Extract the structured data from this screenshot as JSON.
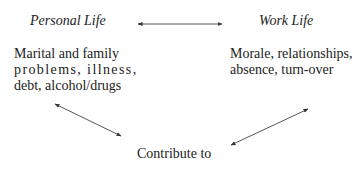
{
  "diagram": {
    "personal": {
      "heading": "Personal Life",
      "lines": [
        "Marital and family",
        "problems, illness,",
        "debt, alcohol/drugs"
      ]
    },
    "work": {
      "heading": "Work Life",
      "lines": [
        "Morale, relationships,",
        "absence, turn-over"
      ]
    },
    "outcome": {
      "label": "Contribute to"
    },
    "edges": [
      {
        "from": "personal",
        "to": "work",
        "type": "bidirectional"
      },
      {
        "from": "personal",
        "to": "outcome",
        "type": "bidirectional"
      },
      {
        "from": "work",
        "to": "outcome",
        "type": "bidirectional"
      }
    ]
  }
}
